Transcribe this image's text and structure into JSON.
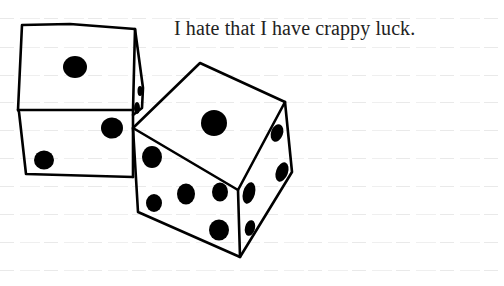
{
  "caption": {
    "text": "I hate that I have crappy luck."
  },
  "paper": {
    "background": "#ffffff",
    "rule_color": "#e9e9e9",
    "rule_y": [
      18,
      47,
      75,
      102,
      130,
      158,
      186,
      214,
      242,
      270
    ]
  },
  "dice": [
    {
      "name": "left-die",
      "visible_faces": {
        "top": 1,
        "front": 2,
        "side": 2
      }
    },
    {
      "name": "right-die",
      "visible_faces": {
        "top": 1,
        "front": 5,
        "side": 4
      }
    }
  ],
  "ink_color": "#000000"
}
